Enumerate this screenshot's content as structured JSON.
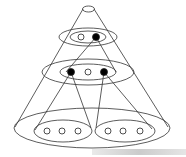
{
  "diagram": {
    "title": "",
    "levels": [
      {
        "name": "level-1",
        "nodes": [
          {
            "filled": false
          },
          {
            "filled": true
          }
        ]
      },
      {
        "name": "level-2",
        "nodes": [
          {
            "filled": true
          },
          {
            "filled": false
          },
          {
            "filled": true
          }
        ]
      },
      {
        "name": "level-3-left",
        "nodes": [
          {
            "filled": false
          },
          {
            "filled": false
          },
          {
            "filled": false
          }
        ]
      },
      {
        "name": "level-3-right",
        "nodes": [
          {
            "filled": false
          },
          {
            "filled": false
          },
          {
            "filled": false
          }
        ]
      }
    ],
    "colors": {
      "stroke": "#222222",
      "fill_node": "#000000",
      "background": "#ffffff"
    }
  },
  "watermark": {
    "text": ""
  }
}
